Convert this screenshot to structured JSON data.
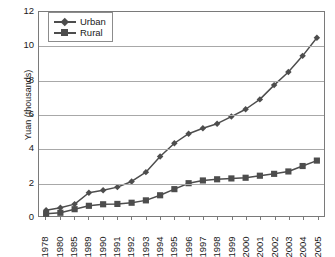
{
  "chart_data": {
    "type": "line",
    "title": "",
    "xlabel": "",
    "ylabel": "Yuan (thousands)",
    "categories": [
      "1978",
      "1980",
      "1985",
      "1989",
      "1990",
      "1991",
      "1992",
      "1993",
      "1994",
      "1995",
      "1996",
      "1997",
      "1998",
      "1999",
      "2000",
      "2001",
      "2002",
      "2003",
      "2004",
      "2005"
    ],
    "series": [
      {
        "name": "Urban",
        "marker": "diamond",
        "color": "#4d4d4d",
        "values": [
          0.34,
          0.48,
          0.7,
          1.37,
          1.52,
          1.7,
          2.03,
          2.58,
          3.5,
          4.28,
          4.84,
          5.16,
          5.43,
          5.85,
          6.28,
          6.86,
          7.7,
          8.47,
          9.42,
          10.49
        ]
      },
      {
        "name": "Rural",
        "marker": "square",
        "color": "#4d4d4d",
        "values": [
          0.13,
          0.19,
          0.4,
          0.6,
          0.69,
          0.71,
          0.78,
          0.92,
          1.22,
          1.58,
          1.93,
          2.09,
          2.16,
          2.21,
          2.25,
          2.37,
          2.48,
          2.62,
          2.94,
          3.26
        ]
      }
    ],
    "ylim": [
      0,
      12
    ],
    "yticks": [
      0,
      2,
      4,
      6,
      8,
      10,
      12
    ],
    "grid": true,
    "grid_axis": "y",
    "legend_position": "top-left"
  },
  "legend": {
    "entries": [
      {
        "label": "Urban"
      },
      {
        "label": "Rural"
      }
    ]
  },
  "colors": {
    "series": "#4d4d4d",
    "gridline": "#a8a8a8",
    "axis": "#7a7a7a",
    "text": "#1a1a1a",
    "background": "#ffffff"
  }
}
